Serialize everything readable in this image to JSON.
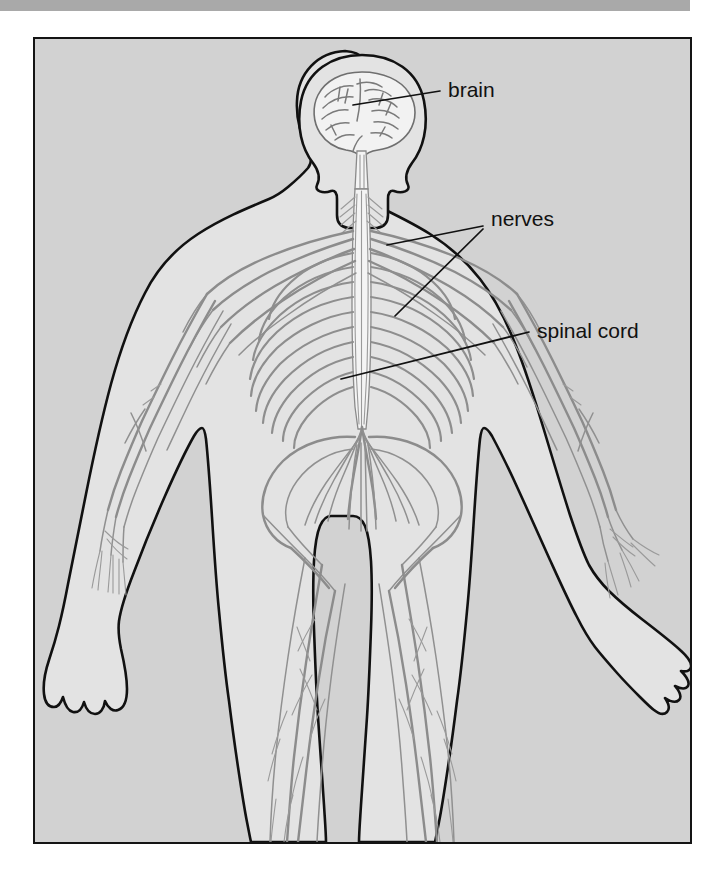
{
  "page": {
    "background_color": "#ffffff",
    "scan_bar_color": "#a9a9a9",
    "plate_background_color": "#d2d2d2",
    "plate_border_color": "#141414",
    "figure_fill_color": "#e3e3e3",
    "nerve_color": "#8c8c8c",
    "label_color": "#111111"
  },
  "diagram": {
    "view": "anterior full-body figure",
    "labels": [
      {
        "id": "brain",
        "text": "brain",
        "text_x": 448,
        "text_y": 88,
        "leader_from_x": 440,
        "leader_from_y": 88,
        "leader_to_x": 352,
        "leader_to_y": 103
      },
      {
        "id": "nerves",
        "text": "nerves",
        "text_x": 490,
        "text_y": 215,
        "leader_from_x": 483,
        "leader_from_y": 220,
        "leader_to_x": 383,
        "leader_to_y": 239,
        "leader2_from_x": 483,
        "leader2_from_y": 224,
        "leader2_to_x": 395,
        "leader2_to_y": 305
      },
      {
        "id": "spinal-cord",
        "text": "spinal cord",
        "text_x": 535,
        "text_y": 327,
        "leader_from_x": 528,
        "leader_from_y": 327,
        "leader_to_x": 338,
        "leader_to_y": 372
      }
    ],
    "structures": [
      "brain",
      "spinal cord",
      "cranial nerves",
      "brachial plexus",
      "intercostal nerves",
      "lumbar plexus",
      "cauda equina",
      "sacral plexus",
      "sciatic nerve",
      "femoral nerve",
      "radial nerve",
      "ulnar nerve",
      "median nerve",
      "tibial nerve",
      "peroneal nerve"
    ]
  }
}
